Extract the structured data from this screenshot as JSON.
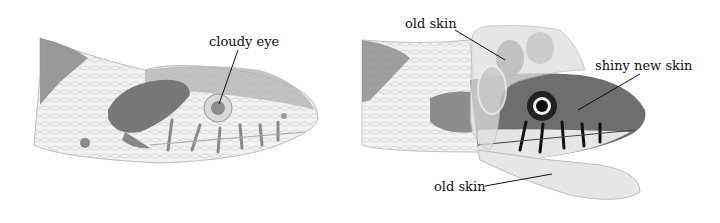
{
  "figure": {
    "left_panel": {
      "labels": [
        {
          "text": "cloudy eye"
        }
      ]
    },
    "right_panel": {
      "labels": [
        {
          "text": "old skin"
        },
        {
          "text": "shiny new skin"
        },
        {
          "text": "old skin"
        }
      ]
    }
  }
}
